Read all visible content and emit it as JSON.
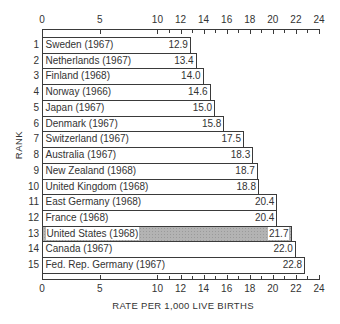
{
  "chart_data": {
    "type": "bar",
    "orientation": "horizontal",
    "title": "",
    "xlabel": "RATE PER 1,000 LIVE BIRTHS",
    "ylabel": "RANK",
    "xlim": [
      0,
      24
    ],
    "x_tick_labels": [
      "0",
      "5",
      "10",
      "12",
      "14",
      "16",
      "18",
      "20",
      "22",
      "24"
    ],
    "x_tick_values": [
      0,
      5,
      10,
      12,
      14,
      16,
      18,
      20,
      22,
      24
    ],
    "x_minor_ticks": [
      11,
      13,
      15,
      17,
      19,
      21,
      23
    ],
    "axis_positions": [
      "top",
      "bottom"
    ],
    "grid": false,
    "highlight_color": "#b3b3b3",
    "categories": [
      "Sweden (1967)",
      "Netherlands (1967)",
      "Finland (1968)",
      "Norway (1966)",
      "Japan (1967)",
      "Denmark (1967)",
      "Switzerland (1967)",
      "Australia (1967)",
      "New Zealand (1968)",
      "United Kingdom (1968)",
      "East Germany (1968)",
      "France (1968)",
      "United States (1968)",
      "Canada (1967)",
      "Fed. Rep. Germany (1967)"
    ],
    "ranks": [
      "1",
      "2",
      "3",
      "4",
      "5",
      "6",
      "7",
      "8",
      "9",
      "10",
      "11",
      "12",
      "13",
      "14",
      "15"
    ],
    "values": [
      12.9,
      13.4,
      14.0,
      14.6,
      15.0,
      15.8,
      17.5,
      18.3,
      18.7,
      18.8,
      20.4,
      20.4,
      21.7,
      22.0,
      22.8
    ],
    "value_labels": [
      "12.9",
      "13.4",
      "14.0",
      "14.6",
      "15.0",
      "15.8",
      "17.5",
      "18.3",
      "18.7",
      "18.8",
      "20.4",
      "20.4",
      "21.7",
      "22.0",
      "22.8"
    ],
    "highlighted": [
      "United States (1968)"
    ]
  }
}
